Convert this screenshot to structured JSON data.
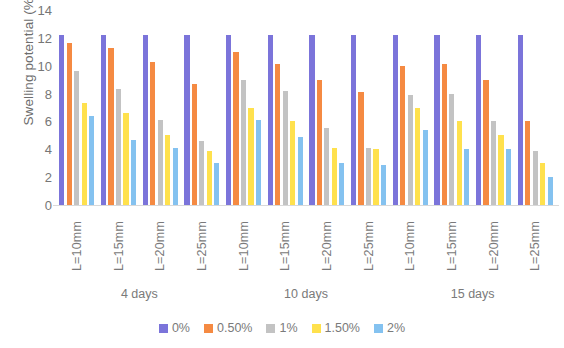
{
  "chart_data": {
    "type": "bar",
    "title": "",
    "subtitle": "",
    "xlabel": "",
    "ylabel": "Swelling potential (%)",
    "ylim": [
      0,
      14
    ],
    "ytick_step": 2,
    "yticks": [
      14,
      12,
      10,
      8,
      6,
      4,
      2,
      0
    ],
    "grid": false,
    "legend_position": "bottom",
    "categories": [
      "L=10mm",
      "L=15mm",
      "L=20mm",
      "L=25mm",
      "L=10mm",
      "L=15mm",
      "L=20mm",
      "L=25mm",
      "L=10mm",
      "L=15mm",
      "L=20mm",
      "L=25mm"
    ],
    "group_labels": [
      "4 days",
      "10 days",
      "15 days"
    ],
    "groups_per_label": 4,
    "series": [
      {
        "name": "0%",
        "color": "#7b74da",
        "values": [
          12.2,
          12.2,
          12.2,
          12.2,
          12.2,
          12.2,
          12.2,
          12.2,
          12.2,
          12.2,
          12.2,
          12.2
        ]
      },
      {
        "name": "0.50%",
        "color": "#f58a42",
        "values": [
          11.6,
          11.3,
          10.3,
          8.7,
          11.0,
          10.1,
          9.0,
          8.1,
          10.0,
          10.1,
          9.0,
          6.0
        ]
      },
      {
        "name": "1%",
        "color": "#c3c3c3",
        "values": [
          9.6,
          8.3,
          6.1,
          4.6,
          9.0,
          8.2,
          5.5,
          4.1,
          7.9,
          8.0,
          6.0,
          3.9
        ]
      },
      {
        "name": "1.50%",
        "color": "#ffe14d",
        "values": [
          7.3,
          6.6,
          5.0,
          3.9,
          7.0,
          6.0,
          4.1,
          4.0,
          7.0,
          6.0,
          5.0,
          3.0
        ]
      },
      {
        "name": "2%",
        "color": "#84c2f0",
        "values": [
          6.4,
          4.7,
          4.1,
          3.0,
          6.1,
          4.9,
          3.0,
          2.9,
          5.4,
          4.0,
          4.0,
          2.0
        ]
      }
    ],
    "legend": [
      {
        "label": "0%",
        "color": "#7b74da"
      },
      {
        "label": "0.50%",
        "color": "#f58a42"
      },
      {
        "label": "1%",
        "color": "#c3c3c3"
      },
      {
        "label": "1.50%",
        "color": "#ffe14d"
      },
      {
        "label": "2%",
        "color": "#84c2f0"
      }
    ]
  }
}
